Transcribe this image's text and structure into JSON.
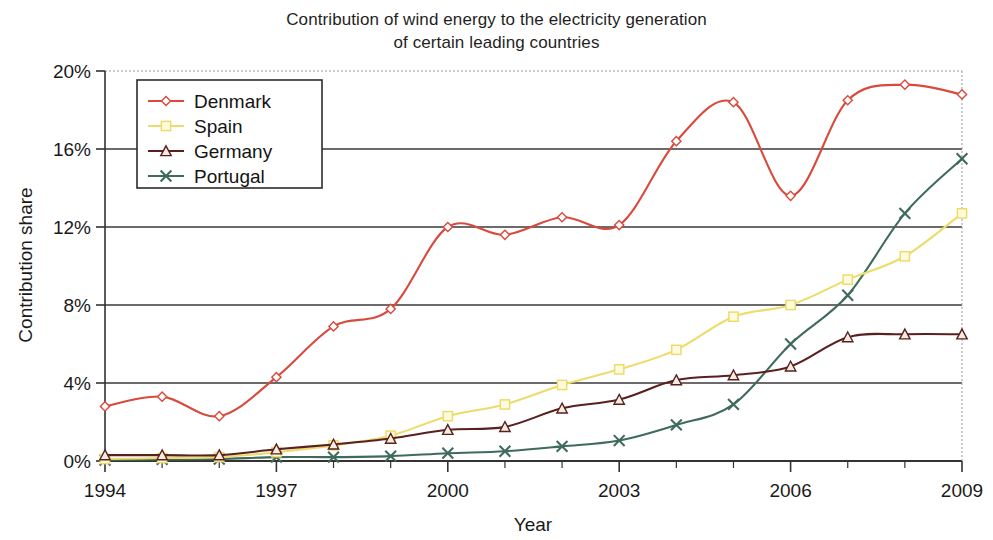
{
  "chart_data": {
    "type": "line",
    "title": "Contribution of wind energy to the electricity generation\nof certain leading countries",
    "xlabel": "Year",
    "ylabel": "Contribution share",
    "x": [
      1994,
      1995,
      1996,
      1997,
      1998,
      1999,
      2000,
      2001,
      2002,
      2003,
      2004,
      2005,
      2006,
      2007,
      2008,
      2009
    ],
    "xlim": [
      1994,
      2009
    ],
    "ylim": [
      0,
      20
    ],
    "x_tick_labels": [
      "1994",
      "1997",
      "2000",
      "2003",
      "2006",
      "2009"
    ],
    "x_tick_values": [
      1994,
      1997,
      2000,
      2003,
      2006,
      2009
    ],
    "y_tick_labels": [
      "0%",
      "4%",
      "8%",
      "12%",
      "16%",
      "20%"
    ],
    "y_tick_values": [
      0,
      4,
      8,
      12,
      16,
      20
    ],
    "grid": "horizontal",
    "legend_position": "upper-left-inside",
    "series": [
      {
        "name": "Denmark",
        "color": "#d94a3d",
        "marker": "diamond",
        "values": [
          2.8,
          3.3,
          2.3,
          4.3,
          6.9,
          7.8,
          12.0,
          11.6,
          12.5,
          12.1,
          16.4,
          18.4,
          13.6,
          18.5,
          19.3,
          18.8
        ]
      },
      {
        "name": "Spain",
        "color": "#eddc6a",
        "marker": "square",
        "values": [
          0.1,
          0.15,
          0.2,
          0.45,
          0.8,
          1.3,
          2.3,
          2.9,
          3.9,
          4.7,
          5.7,
          7.4,
          8.0,
          9.3,
          10.5,
          12.7
        ]
      },
      {
        "name": "Germany",
        "color": "#5a1f1f",
        "marker": "triangle",
        "values": [
          0.3,
          0.3,
          0.3,
          0.6,
          0.85,
          1.15,
          1.6,
          1.75,
          2.7,
          3.15,
          4.15,
          4.4,
          4.85,
          6.35,
          6.5,
          6.5
        ]
      },
      {
        "name": "Portugal",
        "color": "#3e6b5c",
        "marker": "cross",
        "values": [
          0.05,
          0.08,
          0.1,
          0.2,
          0.2,
          0.25,
          0.4,
          0.5,
          0.75,
          1.05,
          1.85,
          2.9,
          6.0,
          8.5,
          12.7,
          15.5
        ]
      }
    ]
  },
  "colors": {
    "denmark": "#d94a3d",
    "spain": "#eddc6a",
    "germany": "#5a1f1f",
    "portugal": "#3e6b5c",
    "axis": "#333333",
    "grid": "#3a3a3a",
    "background": "#ffffff"
  }
}
